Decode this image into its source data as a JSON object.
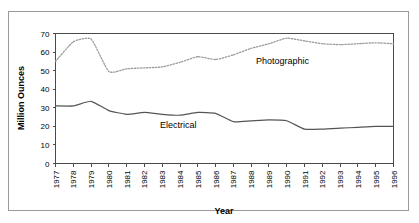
{
  "chart_data": {
    "type": "line",
    "title": "",
    "xlabel": "Year",
    "ylabel": "Million Ounces",
    "ylim": [
      0,
      70
    ],
    "ytick_values": [
      0,
      10,
      20,
      30,
      40,
      50,
      60,
      70
    ],
    "ytick_labels": [
      "0",
      "10",
      "20",
      "30",
      "40",
      "50",
      "60",
      "70"
    ],
    "grid": false,
    "legend_position": "inline-annotation",
    "x": [
      1977,
      1978,
      1979,
      1980,
      1981,
      1982,
      1983,
      1984,
      1985,
      1986,
      1987,
      1988,
      1989,
      1990,
      1991,
      1992,
      1993,
      1994,
      1995,
      1996
    ],
    "categories": [
      "1977",
      "1978",
      "1979",
      "1980",
      "1981",
      "1982",
      "1983",
      "1984",
      "1985",
      "1986",
      "1987",
      "1988",
      "1989",
      "1990",
      "1991",
      "1992",
      "1993",
      "1994",
      "1995",
      "1996"
    ],
    "series": [
      {
        "name": "Photographic",
        "style": "dotted",
        "color": "#9b9b9b",
        "values": [
          55.0,
          65.5,
          67.0,
          49.5,
          51.0,
          51.5,
          52.0,
          54.5,
          57.5,
          56.0,
          58.5,
          62.0,
          64.5,
          67.5,
          66.0,
          64.5,
          64.0,
          64.5,
          65.0,
          64.5
        ]
      },
      {
        "name": "Electrical",
        "style": "solid",
        "color": "#555555",
        "values": [
          31.0,
          31.0,
          33.5,
          28.5,
          26.5,
          27.5,
          26.5,
          26.0,
          27.5,
          27.0,
          22.5,
          23.0,
          23.5,
          23.0,
          18.5,
          18.5,
          19.0,
          19.5,
          20.0,
          20.0
        ]
      }
    ],
    "annotations": [
      {
        "text": "Photographic",
        "series": "Photographic"
      },
      {
        "text": "Electrical",
        "series": "Electrical"
      }
    ]
  }
}
